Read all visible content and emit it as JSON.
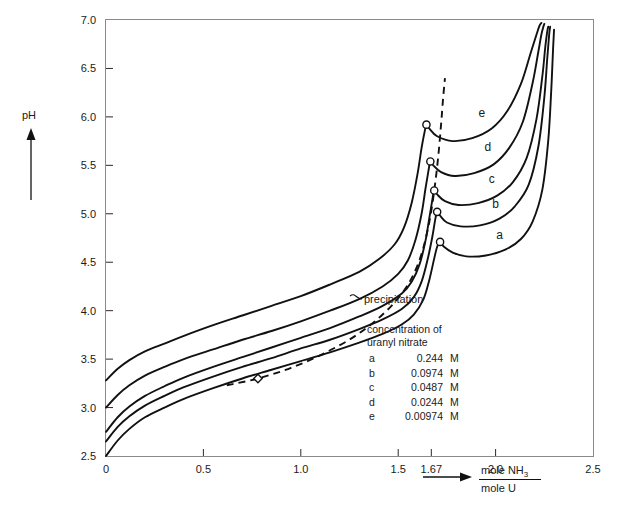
{
  "chart_data": {
    "type": "line",
    "title": "",
    "xlabel": "mole NH3 / mole U",
    "xlabel_numerator": "mole NH",
    "xlabel_numerator_sub": "3",
    "xlabel_denominator": "mole U",
    "ylabel": "pH",
    "xlim": [
      0,
      2.5
    ],
    "ylim": [
      2.5,
      7.0
    ],
    "grid": false,
    "legend_position": "inside-lower-right",
    "xticks": [
      0,
      0.5,
      1.0,
      1.5,
      1.67,
      2.0,
      2.5
    ],
    "xtick_labels": [
      "0",
      "0.5",
      "1.0",
      "1.5",
      "1.67",
      "2.0",
      "2.5"
    ],
    "yticks": [
      2.5,
      3.0,
      3.5,
      4.0,
      4.5,
      5.0,
      5.5,
      6.0,
      6.5,
      7.0
    ],
    "ytick_labels": [
      "2.5",
      "3.0",
      "3.5",
      "4.0",
      "4.5",
      "5.0",
      "5.5",
      "6.0",
      "6.5",
      "7.0"
    ],
    "legend_title_line1": "concentration of",
    "legend_title_line2": "uranyl nitrate",
    "annotations": [
      {
        "text": "precipitation",
        "x": 1.33,
        "y": 4.18
      }
    ],
    "series": [
      {
        "name": "a",
        "label": "a",
        "concentration": "0.244",
        "unit": "M",
        "label_x": 2.02,
        "label_y": 4.74,
        "points": [
          [
            0.0,
            2.5
          ],
          [
            0.06,
            2.66
          ],
          [
            0.12,
            2.78
          ],
          [
            0.2,
            2.9
          ],
          [
            0.3,
            3.0
          ],
          [
            0.4,
            3.09
          ],
          [
            0.55,
            3.2
          ],
          [
            0.7,
            3.3
          ],
          [
            0.85,
            3.39
          ],
          [
            1.0,
            3.48
          ],
          [
            1.15,
            3.57
          ],
          [
            1.3,
            3.67
          ],
          [
            1.42,
            3.76
          ],
          [
            1.52,
            3.86
          ],
          [
            1.58,
            3.96
          ],
          [
            1.63,
            4.12
          ],
          [
            1.66,
            4.32
          ],
          [
            1.685,
            4.54
          ],
          [
            1.7,
            4.66
          ],
          [
            1.715,
            4.71
          ],
          [
            1.735,
            4.66
          ],
          [
            1.78,
            4.6
          ],
          [
            1.85,
            4.56
          ],
          [
            1.95,
            4.57
          ],
          [
            2.05,
            4.63
          ],
          [
            2.13,
            4.74
          ],
          [
            2.19,
            4.92
          ],
          [
            2.24,
            5.25
          ],
          [
            2.27,
            5.75
          ],
          [
            2.285,
            6.25
          ],
          [
            2.295,
            6.7
          ],
          [
            2.3,
            6.9
          ]
        ]
      },
      {
        "name": "b",
        "label": "b",
        "concentration": "0.0974",
        "unit": "M",
        "label_x": 2.0,
        "label_y": 5.06,
        "points": [
          [
            0.0,
            2.65
          ],
          [
            0.06,
            2.8
          ],
          [
            0.12,
            2.91
          ],
          [
            0.2,
            3.02
          ],
          [
            0.3,
            3.12
          ],
          [
            0.4,
            3.21
          ],
          [
            0.55,
            3.32
          ],
          [
            0.7,
            3.42
          ],
          [
            0.85,
            3.51
          ],
          [
            1.0,
            3.61
          ],
          [
            1.15,
            3.7
          ],
          [
            1.3,
            3.81
          ],
          [
            1.42,
            3.91
          ],
          [
            1.52,
            4.02
          ],
          [
            1.58,
            4.14
          ],
          [
            1.62,
            4.3
          ],
          [
            1.65,
            4.52
          ],
          [
            1.675,
            4.76
          ],
          [
            1.69,
            4.94
          ],
          [
            1.7,
            5.02
          ],
          [
            1.715,
            4.98
          ],
          [
            1.75,
            4.91
          ],
          [
            1.82,
            4.87
          ],
          [
            1.92,
            4.88
          ],
          [
            2.02,
            4.95
          ],
          [
            2.1,
            5.08
          ],
          [
            2.17,
            5.3
          ],
          [
            2.22,
            5.7
          ],
          [
            2.25,
            6.2
          ],
          [
            2.265,
            6.6
          ],
          [
            2.275,
            6.85
          ],
          [
            2.28,
            6.93
          ]
        ]
      },
      {
        "name": "c",
        "label": "c",
        "concentration": "0.0487",
        "unit": "M",
        "label_x": 1.98,
        "label_y": 5.32,
        "points": [
          [
            0.0,
            2.75
          ],
          [
            0.06,
            2.9
          ],
          [
            0.12,
            3.01
          ],
          [
            0.2,
            3.12
          ],
          [
            0.3,
            3.22
          ],
          [
            0.4,
            3.31
          ],
          [
            0.55,
            3.42
          ],
          [
            0.7,
            3.52
          ],
          [
            0.85,
            3.62
          ],
          [
            1.0,
            3.72
          ],
          [
            1.15,
            3.82
          ],
          [
            1.3,
            3.94
          ],
          [
            1.42,
            4.05
          ],
          [
            1.52,
            4.18
          ],
          [
            1.57,
            4.3
          ],
          [
            1.61,
            4.48
          ],
          [
            1.64,
            4.72
          ],
          [
            1.66,
            4.96
          ],
          [
            1.675,
            5.14
          ],
          [
            1.685,
            5.24
          ],
          [
            1.7,
            5.2
          ],
          [
            1.74,
            5.13
          ],
          [
            1.81,
            5.09
          ],
          [
            1.91,
            5.11
          ],
          [
            2.01,
            5.19
          ],
          [
            2.09,
            5.33
          ],
          [
            2.16,
            5.58
          ],
          [
            2.21,
            5.98
          ],
          [
            2.24,
            6.42
          ],
          [
            2.255,
            6.72
          ],
          [
            2.265,
            6.88
          ],
          [
            2.27,
            6.93
          ]
        ]
      },
      {
        "name": "d",
        "label": "d",
        "concentration": "0.0244",
        "unit": "M",
        "label_x": 1.96,
        "label_y": 5.65,
        "points": [
          [
            0.0,
            3.0
          ],
          [
            0.06,
            3.13
          ],
          [
            0.12,
            3.23
          ],
          [
            0.2,
            3.33
          ],
          [
            0.3,
            3.42
          ],
          [
            0.4,
            3.5
          ],
          [
            0.55,
            3.6
          ],
          [
            0.7,
            3.7
          ],
          [
            0.85,
            3.79
          ],
          [
            1.0,
            3.89
          ],
          [
            1.15,
            4.0
          ],
          [
            1.3,
            4.12
          ],
          [
            1.42,
            4.25
          ],
          [
            1.5,
            4.38
          ],
          [
            1.55,
            4.52
          ],
          [
            1.59,
            4.74
          ],
          [
            1.62,
            5.0
          ],
          [
            1.64,
            5.26
          ],
          [
            1.655,
            5.44
          ],
          [
            1.665,
            5.54
          ],
          [
            1.68,
            5.5
          ],
          [
            1.72,
            5.43
          ],
          [
            1.79,
            5.39
          ],
          [
            1.89,
            5.42
          ],
          [
            1.99,
            5.51
          ],
          [
            2.07,
            5.68
          ],
          [
            2.14,
            5.95
          ],
          [
            2.19,
            6.35
          ],
          [
            2.22,
            6.68
          ],
          [
            2.235,
            6.85
          ],
          [
            2.245,
            6.93
          ],
          [
            2.25,
            6.96
          ]
        ]
      },
      {
        "name": "e",
        "label": "e",
        "concentration": "0.00974",
        "unit": "M",
        "label_x": 1.93,
        "label_y": 6.0,
        "points": [
          [
            0.0,
            3.28
          ],
          [
            0.06,
            3.4
          ],
          [
            0.12,
            3.49
          ],
          [
            0.2,
            3.58
          ],
          [
            0.3,
            3.66
          ],
          [
            0.4,
            3.74
          ],
          [
            0.55,
            3.85
          ],
          [
            0.7,
            3.95
          ],
          [
            0.85,
            4.05
          ],
          [
            1.0,
            4.15
          ],
          [
            1.15,
            4.27
          ],
          [
            1.3,
            4.4
          ],
          [
            1.4,
            4.53
          ],
          [
            1.48,
            4.68
          ],
          [
            1.53,
            4.86
          ],
          [
            1.57,
            5.12
          ],
          [
            1.6,
            5.42
          ],
          [
            1.62,
            5.68
          ],
          [
            1.635,
            5.84
          ],
          [
            1.645,
            5.92
          ],
          [
            1.66,
            5.88
          ],
          [
            1.7,
            5.8
          ],
          [
            1.78,
            5.75
          ],
          [
            1.88,
            5.78
          ],
          [
            1.98,
            5.88
          ],
          [
            2.06,
            6.06
          ],
          [
            2.13,
            6.34
          ],
          [
            2.18,
            6.66
          ],
          [
            2.21,
            6.85
          ],
          [
            2.225,
            6.94
          ],
          [
            2.235,
            6.97
          ]
        ]
      }
    ],
    "precipitation_curve": {
      "name": "precipitation",
      "style": "dashed",
      "points": [
        [
          0.62,
          3.23
        ],
        [
          0.78,
          3.3
        ],
        [
          0.95,
          3.41
        ],
        [
          1.12,
          3.56
        ],
        [
          1.28,
          3.74
        ],
        [
          1.42,
          3.96
        ],
        [
          1.52,
          4.18
        ],
        [
          1.58,
          4.38
        ],
        [
          1.625,
          4.62
        ],
        [
          1.66,
          4.92
        ],
        [
          1.685,
          5.24
        ],
        [
          1.705,
          5.58
        ],
        [
          1.72,
          5.92
        ],
        [
          1.73,
          6.18
        ],
        [
          1.74,
          6.4
        ]
      ],
      "diamond_marker": [
        0.78,
        3.3
      ]
    },
    "precipitation_markers": [
      [
        1.715,
        4.71
      ],
      [
        1.7,
        5.02
      ],
      [
        1.685,
        5.24
      ],
      [
        1.665,
        5.54
      ],
      [
        1.645,
        5.92
      ]
    ]
  }
}
